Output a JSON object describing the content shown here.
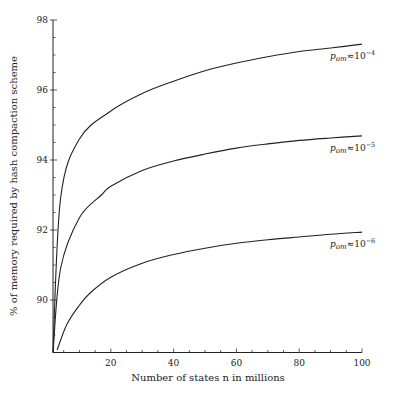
{
  "chart_data": {
    "type": "line",
    "title": "",
    "xlabel": "Number of states n in millions",
    "ylabel": "% of memory required by hash compaction scheme",
    "xlim": [
      1.6,
      100
    ],
    "ylim": [
      88.5,
      98
    ],
    "xticks": [
      20,
      40,
      60,
      80,
      100
    ],
    "yticks": [
      90,
      92,
      94,
      96,
      98
    ],
    "grid": false,
    "legend": "inline labels at right end of curves",
    "series": [
      {
        "name": "p_om ≈ 10^-4",
        "label_base": "p",
        "label_sub": "om",
        "label_rel": "≈10",
        "label_exp": "−4",
        "x": [
          1.6,
          4,
          10,
          20,
          30,
          40,
          50,
          60,
          70,
          80,
          90,
          100
        ],
        "values": [
          88.5,
          92.9,
          94.6,
          95.4,
          95.9,
          96.25,
          96.55,
          96.77,
          96.95,
          97.1,
          97.2,
          97.31
        ]
      },
      {
        "name": "p_om ≈ 10^-5",
        "label_base": "p",
        "label_sub": "om",
        "label_rel": "≈10",
        "label_exp": "−5",
        "x": [
          1.6,
          4,
          10,
          17,
          20,
          30,
          40,
          50,
          60,
          70,
          80,
          90,
          100
        ],
        "values": [
          88.5,
          90.9,
          92.35,
          93.0,
          93.25,
          93.7,
          93.97,
          94.17,
          94.34,
          94.46,
          94.56,
          94.63,
          94.69
        ]
      },
      {
        "name": "p_om ≈ 10^-6",
        "label_base": "p",
        "label_sub": "om",
        "label_rel": "≈10",
        "label_exp": "−6",
        "x": [
          2.9,
          6,
          10,
          13.4,
          20,
          30,
          40,
          50,
          60,
          70,
          80,
          90,
          100
        ],
        "values": [
          88.57,
          89.3,
          89.85,
          90.2,
          90.65,
          91.05,
          91.3,
          91.48,
          91.62,
          91.72,
          91.8,
          91.88,
          91.94
        ]
      }
    ]
  }
}
